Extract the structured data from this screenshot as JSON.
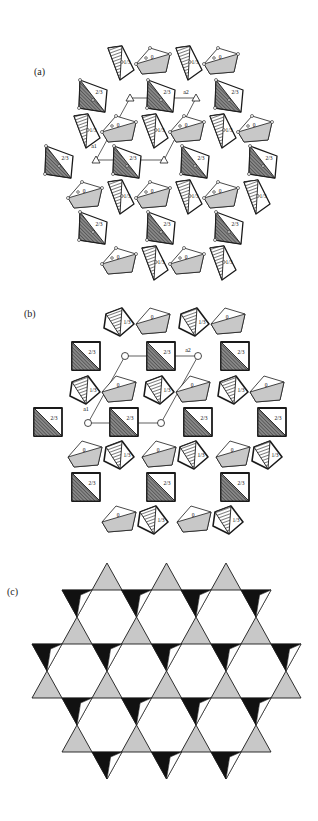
{
  "figure": {
    "colors": {
      "background": "#ffffff",
      "line": "#1a1a1a",
      "gray_fill": "#c8c8c8",
      "dark_fill": "#6e6e6e",
      "black_fill": "#111111"
    },
    "panels": [
      {
        "id": "a",
        "label": "(a)",
        "label_pos": [
          34,
          73
        ],
        "tile_labels": {
          "zero": "0",
          "one_third": "1/3",
          "two_thirds": "2/3"
        },
        "axis_labels": {
          "a1": "a1",
          "a2": "a2"
        },
        "hatched_pairs": [
          {
            "x": 118,
            "y": 62,
            "order": "hatch-first"
          },
          {
            "x": 186,
            "y": 62,
            "order": "hatch-first"
          },
          {
            "x": 84,
            "y": 130,
            "order": "hatch-first"
          },
          {
            "x": 152,
            "y": 130,
            "order": "hatch-first"
          },
          {
            "x": 220,
            "y": 130,
            "order": "hatch-first"
          },
          {
            "x": 84,
            "y": 196,
            "order": "gray-first"
          },
          {
            "x": 152,
            "y": 196,
            "order": "gray-first"
          },
          {
            "x": 220,
            "y": 196,
            "order": "gray-first"
          },
          {
            "x": 118,
            "y": 262,
            "order": "gray-first"
          },
          {
            "x": 186,
            "y": 262,
            "order": "gray-first"
          }
        ],
        "dark_tiles": [
          {
            "x": 93,
            "y": 96
          },
          {
            "x": 161,
            "y": 96
          },
          {
            "x": 229,
            "y": 96
          },
          {
            "x": 59,
            "y": 162
          },
          {
            "x": 127,
            "y": 162
          },
          {
            "x": 195,
            "y": 162
          },
          {
            "x": 263,
            "y": 162
          },
          {
            "x": 93,
            "y": 228
          },
          {
            "x": 161,
            "y": 228
          },
          {
            "x": 229,
            "y": 228
          }
        ],
        "unit_cell": [
          [
            130,
            98
          ],
          [
            196,
            98
          ],
          [
            164,
            160
          ],
          [
            96,
            160
          ]
        ]
      },
      {
        "id": "b",
        "label": "(b)",
        "label_pos": [
          24,
          316
        ],
        "tile_labels": {
          "zero": "0",
          "one_third": "1/3",
          "two_thirds": "2/3"
        },
        "axis_labels": {
          "a1": "a1",
          "a2": "a2"
        },
        "hatched_pairs": [
          {
            "x": 118,
            "y": 322,
            "order": "hatch-first"
          },
          {
            "x": 193,
            "y": 322,
            "order": "hatch-first"
          },
          {
            "x": 84,
            "y": 390,
            "order": "hatch-first"
          },
          {
            "x": 158,
            "y": 390,
            "order": "hatch-first"
          },
          {
            "x": 232,
            "y": 390,
            "order": "hatch-first"
          },
          {
            "x": 84,
            "y": 455,
            "order": "gray-first"
          },
          {
            "x": 158,
            "y": 455,
            "order": "gray-first"
          },
          {
            "x": 232,
            "y": 455,
            "order": "gray-first"
          },
          {
            "x": 118,
            "y": 520,
            "order": "gray-first"
          },
          {
            "x": 193,
            "y": 520,
            "order": "gray-first"
          }
        ],
        "dark_tiles": [
          {
            "x": 86,
            "y": 356
          },
          {
            "x": 161,
            "y": 356
          },
          {
            "x": 235,
            "y": 356
          },
          {
            "x": 48,
            "y": 422
          },
          {
            "x": 124,
            "y": 422
          },
          {
            "x": 198,
            "y": 422
          },
          {
            "x": 272,
            "y": 422
          },
          {
            "x": 86,
            "y": 487
          },
          {
            "x": 161,
            "y": 487
          },
          {
            "x": 235,
            "y": 487
          }
        ],
        "unit_cell": [
          [
            125,
            356
          ],
          [
            198,
            356
          ],
          [
            161,
            423
          ],
          [
            88,
            423
          ]
        ]
      },
      {
        "id": "c",
        "label": "(c)",
        "label_pos": [
          7,
          593
        ],
        "kagome": {
          "side": 30,
          "rows": [
            {
              "y": 590,
              "x_start": 92,
              "count": 3,
              "type": "up-top"
            },
            {
              "y": 644,
              "x_start": 62,
              "count": 5
            },
            {
              "y": 698,
              "x_start": 32,
              "count": 5
            },
            {
              "y": 752,
              "x_start": 62,
              "count": 4
            }
          ]
        }
      }
    ]
  }
}
